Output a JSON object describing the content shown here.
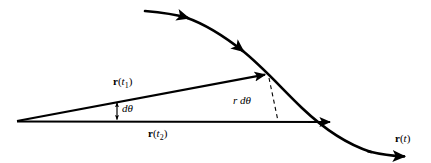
{
  "figure": {
    "background_color": "#ffffff",
    "stroke_color": "#000000",
    "labels": {
      "r_t1": {
        "base": "r",
        "paren_open": "(",
        "var": "t",
        "sub": "1",
        "paren_close": ")"
      },
      "r_t2": {
        "base": "r",
        "paren_open": "(",
        "var": "t",
        "sub": "2",
        "paren_close": ")"
      },
      "r_t": {
        "base": "r",
        "paren_open": "(",
        "var": "t",
        "sub": "",
        "paren_close": ")"
      },
      "d_theta": "dθ",
      "r_d_theta": "r dθ"
    },
    "geometry": {
      "origin": {
        "x": 17,
        "y": 121
      },
      "r_t1_tip": {
        "x": 268,
        "y": 74
      },
      "r_t2_tip": {
        "x": 333,
        "y": 122
      },
      "curve_start": {
        "x": 145,
        "y": 11
      },
      "curve_end": {
        "x": 407,
        "y": 156
      },
      "dashed_top": {
        "x": 269,
        "y": 78
      },
      "dashed_bottom": {
        "x": 278,
        "y": 121
      },
      "dtheta_marker_x": 117
    }
  }
}
